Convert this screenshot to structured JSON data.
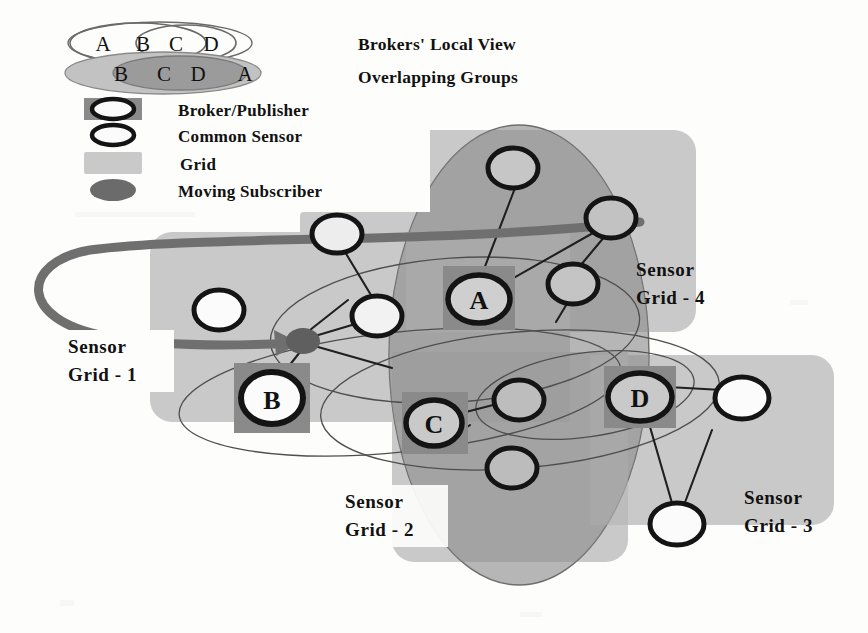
{
  "figure": {
    "headings": {
      "brokers_local_view": "Brokers' Local View",
      "overlapping_groups": "Overlapping Groups"
    },
    "legend": [
      {
        "key": "broker-publisher",
        "label": "Broker/Publisher",
        "swatch": "ring-on-dark-square",
        "swatch_color": "#8a8a8a",
        "ring_color": "#141414"
      },
      {
        "key": "common-sensor",
        "label": "Common Sensor",
        "swatch": "ring-on-white",
        "swatch_color": "#ffffff",
        "ring_color": "#141414"
      },
      {
        "key": "grid",
        "label": "Grid",
        "swatch": "filled-rect",
        "swatch_color": "#c9c9c9",
        "ring_color": "#c9c9c9"
      },
      {
        "key": "moving-subscriber",
        "label": "Moving Subscriber",
        "swatch": "filled-ellipse",
        "swatch_color": "#6b6b6b",
        "ring_color": "#5a5a5a"
      }
    ],
    "venn": {
      "row1": {
        "style": "outline",
        "labels": [
          "A",
          "B",
          "C",
          "D"
        ]
      },
      "row2": {
        "style": "filled",
        "labels": [
          "B",
          "C",
          "D",
          "A"
        ]
      }
    },
    "grids": [
      {
        "id": "grid-1",
        "label_line1": "Sensor",
        "label_line2": "Grid - 1"
      },
      {
        "id": "grid-2",
        "label_line1": "Sensor",
        "label_line2": "Grid - 2"
      },
      {
        "id": "grid-3",
        "label_line1": "Sensor",
        "label_line2": "Grid - 3"
      },
      {
        "id": "grid-4",
        "label_line1": "Sensor",
        "label_line2": "Grid - 4"
      }
    ],
    "brokers": [
      {
        "id": "broker-a",
        "label": "A",
        "cx": 479,
        "cy": 299,
        "rx": 30,
        "ry": 23
      },
      {
        "id": "broker-b",
        "label": "B",
        "cx": 272,
        "cy": 398,
        "rx": 30,
        "ry": 25
      },
      {
        "id": "broker-c",
        "label": "C",
        "cx": 434,
        "cy": 423,
        "rx": 27,
        "ry": 22
      },
      {
        "id": "broker-d",
        "label": "D",
        "cx": 640,
        "cy": 397,
        "rx": 31,
        "ry": 23
      }
    ],
    "common_sensors": [
      {
        "id": "sensor-1",
        "cx": 337,
        "cy": 234,
        "rx": 25,
        "ry": 19
      },
      {
        "id": "sensor-2",
        "cx": 219,
        "cy": 310,
        "rx": 24,
        "ry": 19
      },
      {
        "id": "sensor-3",
        "cx": 377,
        "cy": 316,
        "rx": 24,
        "ry": 19
      },
      {
        "id": "sensor-4",
        "cx": 513,
        "cy": 168,
        "rx": 24,
        "ry": 19
      },
      {
        "id": "sensor-5",
        "cx": 611,
        "cy": 218,
        "rx": 24,
        "ry": 19
      },
      {
        "id": "sensor-6",
        "cx": 573,
        "cy": 284,
        "rx": 24,
        "ry": 19
      },
      {
        "id": "sensor-7",
        "cx": 519,
        "cy": 400,
        "rx": 24,
        "ry": 19
      },
      {
        "id": "sensor-8",
        "cx": 512,
        "cy": 468,
        "rx": 24,
        "ry": 19
      },
      {
        "id": "sensor-9",
        "cx": 742,
        "cy": 398,
        "rx": 26,
        "ry": 20
      },
      {
        "id": "sensor-10",
        "cx": 677,
        "cy": 524,
        "rx": 26,
        "ry": 20
      }
    ],
    "moving_subscriber": {
      "id": "moving-subscriber",
      "cx": 303,
      "cy": 341,
      "rx": 16,
      "ry": 12
    },
    "colors": {
      "grid_light": "#c9c9c9",
      "grid_mid": "#b3b3b3",
      "group_ellipse": "#9f9f9f",
      "broker_square": "#8a8a8a",
      "stroke_dark": "#141414",
      "path_arrow": "#6f6f6f",
      "subscriber": "#6b6b6b",
      "background": "#fdfdfc"
    }
  }
}
